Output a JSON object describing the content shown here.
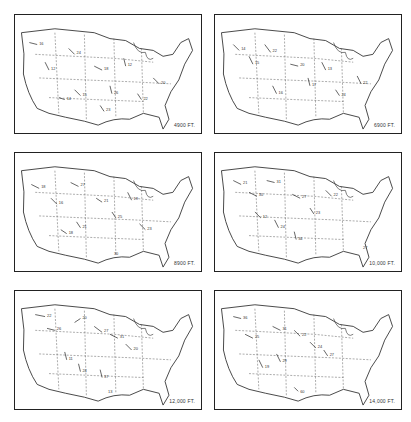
{
  "figure": {
    "panels": [
      {
        "id": "p1",
        "altitude_label": "4900 FT.",
        "left": 14,
        "top": 14
      },
      {
        "id": "p2",
        "altitude_label": "6900 FT.",
        "left": 214,
        "top": 14
      },
      {
        "id": "p3",
        "altitude_label": "8900 FT.",
        "left": 14,
        "top": 152
      },
      {
        "id": "p4",
        "altitude_label": "10,000 FT.",
        "left": 214,
        "top": 152
      },
      {
        "id": "p5",
        "altitude_label": "12,000 FT.",
        "left": 14,
        "top": 290
      },
      {
        "id": "p6",
        "altitude_label": "14,000 FT.",
        "left": 214,
        "top": 290
      }
    ]
  },
  "icons": {
    "wind-arrow": "arrow with station speed label",
    "state-boundary": "dashed line"
  }
}
